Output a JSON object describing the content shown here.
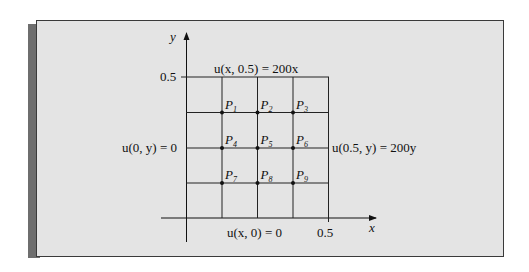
{
  "figure": {
    "axes": {
      "x_label": "x",
      "y_label": "y",
      "x_tick": "0.5",
      "y_tick": "0.5"
    },
    "boundary_conditions": {
      "top": "u(x, 0.5) = 200x",
      "bottom": "u(x, 0) = 0",
      "left": "u(0, y) = 0",
      "right": "u(0.5, y) = 200y"
    },
    "grid": {
      "domain": [
        0,
        0.5
      ],
      "divisions": 4,
      "nodes": [
        {
          "label": "P",
          "sub": "1"
        },
        {
          "label": "P",
          "sub": "2"
        },
        {
          "label": "P",
          "sub": "3"
        },
        {
          "label": "P",
          "sub": "4"
        },
        {
          "label": "P",
          "sub": "5"
        },
        {
          "label": "P",
          "sub": "6"
        },
        {
          "label": "P",
          "sub": "7"
        },
        {
          "label": "P",
          "sub": "8"
        },
        {
          "label": "P",
          "sub": "9"
        }
      ]
    },
    "colors": {
      "panel_bg": "#e4e4e4",
      "border": "#3a3a3a",
      "shadow": "#6e6e6e",
      "ink": "#111111"
    }
  }
}
